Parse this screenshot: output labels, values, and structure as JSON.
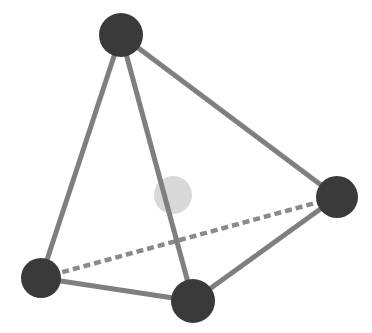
{
  "canvas": {
    "width": 372,
    "height": 333,
    "background": "#ffffff",
    "title": "Tetrahedron wireframe with centroid marker"
  },
  "style": {
    "vertex_color": "#3a3a3a",
    "edge_color": "#7f7f7f",
    "hidden_edge_color": "#8a8a8a",
    "centroid_color": "#d9d9d9",
    "edge_width": 5,
    "hidden_edge_width": 4.5,
    "hidden_edge_dash": "7 4"
  },
  "chart_data": {
    "type": "scatter",
    "title": "Tetrahedron wireframe with centroid marker",
    "xlabel": "",
    "ylabel": "",
    "xlim": [
      0,
      372
    ],
    "ylim": [
      0,
      333
    ],
    "grid": false,
    "legend": "none",
    "vertices": [
      {
        "id": "apex",
        "label": "A",
        "x": 121,
        "y": 35,
        "r": 22,
        "color": "#3a3a3a"
      },
      {
        "id": "right",
        "label": "B",
        "x": 337,
        "y": 197,
        "r": 21,
        "color": "#3a3a3a"
      },
      {
        "id": "bottom-left",
        "label": "C",
        "x": 41,
        "y": 278,
        "r": 20,
        "color": "#3a3a3a"
      },
      {
        "id": "bottom-front",
        "label": "D",
        "x": 193,
        "y": 301,
        "r": 22,
        "color": "#3a3a3a"
      }
    ],
    "centroid": {
      "id": "centroid",
      "label": "center",
      "x": 173,
      "y": 195,
      "r": 19,
      "color": "#d9d9d9"
    },
    "edges": [
      {
        "from": "apex",
        "to": "bottom-left",
        "style": "solid",
        "hidden": false
      },
      {
        "from": "apex",
        "to": "bottom-front",
        "style": "solid",
        "hidden": false
      },
      {
        "from": "apex",
        "to": "right",
        "style": "solid",
        "hidden": false
      },
      {
        "from": "bottom-left",
        "to": "bottom-front",
        "style": "solid",
        "hidden": false
      },
      {
        "from": "bottom-front",
        "to": "right",
        "style": "solid",
        "hidden": false
      },
      {
        "from": "bottom-left",
        "to": "right",
        "style": "dashed",
        "hidden": true
      }
    ]
  }
}
